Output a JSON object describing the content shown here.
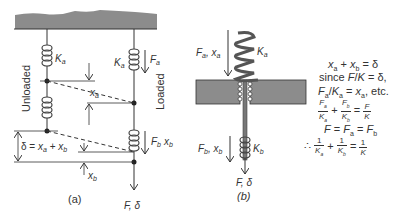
{
  "diagram_a": {
    "caption": "(a)",
    "unloaded_label": "Unloaded",
    "loaded_label": "Loaded",
    "spring_a_label": "K_a",
    "spring_a_loaded_label": "K_a",
    "force_a_label": "F_a",
    "force_b_label": "F_b",
    "disp_b_side_label": "x_b",
    "xa_label": "x_a",
    "xb_label": "x_b",
    "delta_label": "δ = x_a + x_b",
    "output_label": "F, δ"
  },
  "diagram_b": {
    "caption": "(b)",
    "top_load_label": "F_a, x_a",
    "spring_a_label": "K_a",
    "bottom_load_label": "F_b, x_b",
    "spring_b_label": "K_b",
    "output_label": "F, δ"
  },
  "equations": {
    "line1": "x_a + x_b = δ",
    "line2": "since F/K = δ,",
    "line3": "F_a/K_a = x_a, etc.",
    "line4_terms": [
      {
        "num": "F_a",
        "den": "K_a"
      },
      {
        "num": "F_b",
        "den": "K_b"
      },
      {
        "num": "F",
        "den": "K"
      }
    ],
    "line5": "F = F_a = F_b",
    "line6_prefix": "∴",
    "line6_terms": [
      {
        "num": "1",
        "den": "K_a"
      },
      {
        "num": "1",
        "den": "K_b"
      },
      {
        "num": "1",
        "den": "K"
      }
    ]
  },
  "colors": {
    "ground": "#8c8c8c",
    "line": "#333333",
    "spring_dark": "#555555"
  }
}
